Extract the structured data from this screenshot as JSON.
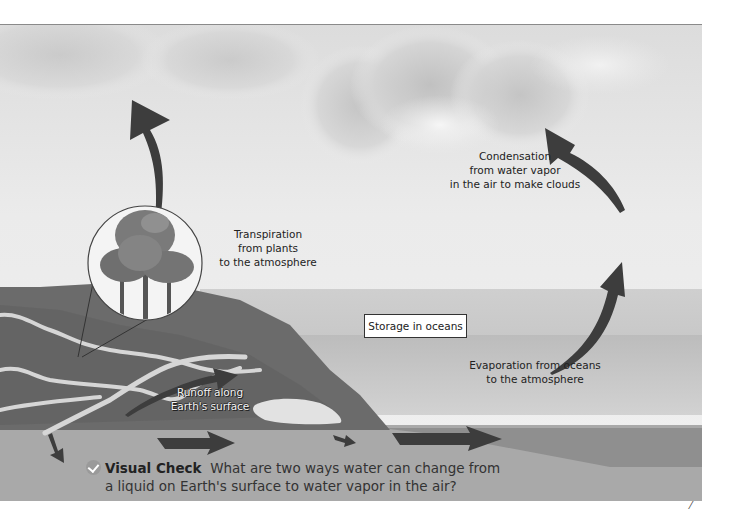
{
  "figure": {
    "labels": {
      "transpiration": [
        "Transpiration",
        "from plants",
        "to the atmosphere"
      ],
      "condensation": [
        "Condensation",
        "from water vapor",
        "in the air to make clouds"
      ],
      "storage": "Storage in oceans",
      "evaporation": [
        "Evaporation from oceans",
        "to the atmosphere"
      ],
      "runoff": [
        "Runoff along",
        "Earth's surface"
      ]
    },
    "icons": [
      "transpiration-arrow-icon",
      "condensation-arrow-icon",
      "evaporation-arrow-icon",
      "runoff-arrow-icon",
      "groundwater-arrow-icon",
      "tree-magnifier-icon",
      "check-icon"
    ]
  },
  "visual_check": {
    "title": "Visual Check",
    "question_line1": "What are two ways water can change from",
    "question_line2": "a liquid on Earth's surface to water vapor in the air?"
  },
  "colors": {
    "sky": "#ececec",
    "cloud": "#bdbdbd",
    "land": "#6e6e6e",
    "river": "#d4d4d4",
    "ocean_upper": "#c4c4c4",
    "ocean_lower": "#b6b6b6",
    "ground": "#a8a8a8",
    "deep_water": "#8e8e8e",
    "arrow": "#3d3d3d"
  }
}
